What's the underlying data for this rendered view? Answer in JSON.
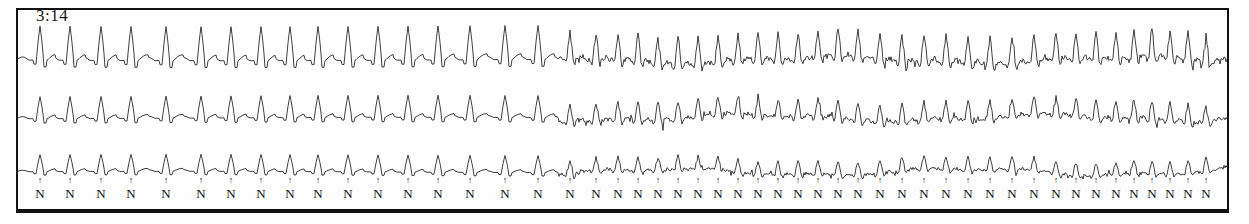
{
  "strip": {
    "time_label": "3:14",
    "channels": [
      {
        "name": "channel-1",
        "baseline_y": 60
      },
      {
        "name": "channel-2",
        "baseline_y": 118
      },
      {
        "name": "channel-3",
        "baseline_y": 172
      }
    ],
    "beat_label": "N",
    "beat_marker_glyph": "↑",
    "colors": {
      "trace": "#2a2a2a",
      "frame": "#111111",
      "background": "#fefefe",
      "annotation": "#0d0d0d"
    }
  },
  "chart_data": {
    "type": "line",
    "title": "3:14",
    "xlabel": "",
    "ylabel": "",
    "grid": false,
    "legend": "none",
    "x": [
      0,
      1209
    ],
    "xlim": [
      0,
      1209
    ],
    "ylim": [
      -1,
      1
    ],
    "series": [
      {
        "name": "channel-1",
        "baseline_y": 60,
        "clean_amplitude": 34,
        "noisy_amplitude": 26,
        "noise_level": 0.55
      },
      {
        "name": "channel-2",
        "baseline_y": 118,
        "clean_amplitude": 22,
        "noisy_amplitude": 18,
        "noise_level": 0.45
      },
      {
        "name": "channel-3",
        "baseline_y": 172,
        "clean_amplitude": 17,
        "noisy_amplitude": 13,
        "noise_level": 0.35
      }
    ],
    "transition_x": 540,
    "beat_positions": [
      22,
      52,
      83,
      113,
      148,
      183,
      213,
      243,
      272,
      300,
      330,
      360,
      390,
      420,
      452,
      487,
      520,
      552,
      578,
      600,
      620,
      640,
      660,
      680,
      700,
      720,
      740,
      760,
      780,
      800,
      820,
      840,
      862,
      884,
      906,
      928,
      950,
      972,
      994,
      1016,
      1038,
      1058,
      1078,
      1098,
      1116,
      1134,
      1152,
      1170,
      1188
    ],
    "beat_labels": [
      "N",
      "N",
      "N",
      "N",
      "N",
      "N",
      "N",
      "N",
      "N",
      "N",
      "N",
      "N",
      "N",
      "N",
      "N",
      "N",
      "N",
      "N",
      "N",
      "N",
      "N",
      "N",
      "N",
      "N",
      "N",
      "N",
      "N",
      "N",
      "N",
      "N",
      "N",
      "N",
      "N",
      "N",
      "N",
      "N",
      "N",
      "N",
      "N",
      "N",
      "N",
      "N",
      "N",
      "N",
      "N",
      "N",
      "N",
      "N",
      "N"
    ]
  }
}
